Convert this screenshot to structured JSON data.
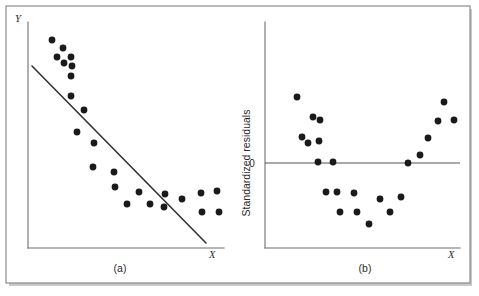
{
  "figure": {
    "caption_a": "(a)",
    "caption_b": "(b)",
    "frame_color": "#8b8b8b",
    "point_color": "#1a1a1a",
    "line_color": "#333333",
    "background": "#ffffff"
  },
  "chart_data": [
    {
      "type": "scatter",
      "panel": "(a)",
      "title": "",
      "xlabel": "X",
      "ylabel": "Y",
      "grid": false,
      "legend": null,
      "xticklabels": [],
      "yticklabels": [],
      "axis_style": "two-sided open axes with arrowless X and Y lines",
      "description": "Scatter of Y versus X with a fitted straight regression line showing a negative slope; the points follow a curved (convex) pattern so they lie above the line at both ends and below it in the middle.",
      "points": [
        {
          "x": 52,
          "y": 40
        },
        {
          "x": 63,
          "y": 48
        },
        {
          "x": 57,
          "y": 57
        },
        {
          "x": 71,
          "y": 57
        },
        {
          "x": 64,
          "y": 63
        },
        {
          "x": 72,
          "y": 66
        },
        {
          "x": 71,
          "y": 76
        },
        {
          "x": 71,
          "y": 96
        },
        {
          "x": 84,
          "y": 110
        },
        {
          "x": 77,
          "y": 132
        },
        {
          "x": 94,
          "y": 143
        },
        {
          "x": 93,
          "y": 167
        },
        {
          "x": 114,
          "y": 172
        },
        {
          "x": 115,
          "y": 187
        },
        {
          "x": 139,
          "y": 192
        },
        {
          "x": 127,
          "y": 204
        },
        {
          "x": 150,
          "y": 204
        },
        {
          "x": 165,
          "y": 194
        },
        {
          "x": 164,
          "y": 207
        },
        {
          "x": 182,
          "y": 199
        },
        {
          "x": 201,
          "y": 193
        },
        {
          "x": 202,
          "y": 212
        },
        {
          "x": 217,
          "y": 191
        },
        {
          "x": 219,
          "y": 212
        }
      ],
      "fit_line": {
        "x1": 32,
        "y1": 66,
        "x2": 206,
        "y2": 243,
        "kind": "linear-regression"
      },
      "axes": {
        "x_axis_y": 248,
        "y_axis_x": 28,
        "x_axis_x1": 28,
        "x_axis_x2": 224,
        "y_axis_y1": 22,
        "y_axis_y2": 248
      }
    },
    {
      "type": "scatter",
      "panel": "(b)",
      "title": "",
      "xlabel": "X",
      "ylabel": "Standardized residuals",
      "grid": false,
      "legend": null,
      "yticklabels": [
        "0"
      ],
      "xticklabels": [],
      "description": "Residual plot of standardized residuals versus X. The residuals form a clear U-shaped (curvilinear) pattern: positive at low X, negative in the middle, and positive again at high X, indicating the linear model is inadequate.",
      "zero_line": {
        "y": 163,
        "x1": 265,
        "x2": 460,
        "label": "0"
      },
      "points": [
        {
          "x": 297,
          "y": 97
        },
        {
          "x": 313,
          "y": 117
        },
        {
          "x": 320,
          "y": 120
        },
        {
          "x": 302,
          "y": 137
        },
        {
          "x": 308,
          "y": 143
        },
        {
          "x": 319,
          "y": 141
        },
        {
          "x": 318,
          "y": 162
        },
        {
          "x": 333,
          "y": 162
        },
        {
          "x": 326,
          "y": 192
        },
        {
          "x": 337,
          "y": 192
        },
        {
          "x": 354,
          "y": 193
        },
        {
          "x": 340,
          "y": 212
        },
        {
          "x": 357,
          "y": 212
        },
        {
          "x": 369,
          "y": 224
        },
        {
          "x": 380,
          "y": 199
        },
        {
          "x": 390,
          "y": 212
        },
        {
          "x": 401,
          "y": 197
        },
        {
          "x": 408,
          "y": 163
        },
        {
          "x": 420,
          "y": 155
        },
        {
          "x": 428,
          "y": 138
        },
        {
          "x": 438,
          "y": 121
        },
        {
          "x": 444,
          "y": 102
        },
        {
          "x": 454,
          "y": 120
        }
      ],
      "axes": {
        "x_axis_y": 248,
        "y_axis_x": 265,
        "x_axis_x1": 265,
        "x_axis_x2": 460,
        "y_axis_y1": 22,
        "y_axis_y2": 248
      }
    }
  ]
}
